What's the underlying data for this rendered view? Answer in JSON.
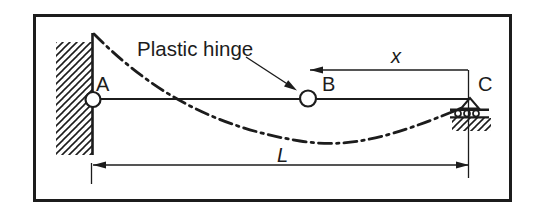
{
  "figure": {
    "type": "structural-beam-diagram",
    "colors": {
      "background": "#ffffff",
      "ink": "#1c1c1c"
    },
    "labels": {
      "point_a": "A",
      "point_b": "B",
      "point_c": "C",
      "annotation": "Plastic hinge",
      "dim_x": "x",
      "dim_span": "L"
    }
  }
}
